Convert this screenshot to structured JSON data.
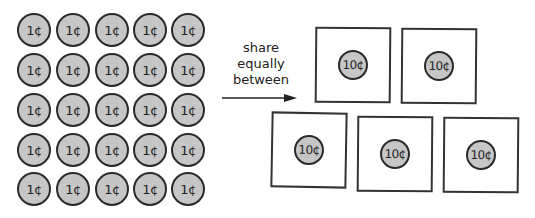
{
  "diagram": {
    "source_group": {
      "coin_label": "1¢",
      "rows": 5,
      "cols": 5,
      "count": 25,
      "coin_fill": "#c6c6c6",
      "centers_x": [
        34,
        73,
        112,
        150,
        188
      ],
      "centers_y": [
        30,
        70,
        110,
        150,
        189
      ]
    },
    "instruction": {
      "lines": [
        "share",
        "equally",
        "between"
      ]
    },
    "target_boxes": [
      {
        "coin_label": "10¢",
        "x": 315,
        "y": 27,
        "rot": 0.5
      },
      {
        "coin_label": "10¢",
        "x": 401,
        "y": 28,
        "rot": 0.5
      },
      {
        "coin_label": "10¢",
        "x": 271,
        "y": 112,
        "rot": 1
      },
      {
        "coin_label": "10¢",
        "x": 357,
        "y": 116,
        "rot": 0.5
      },
      {
        "coin_label": "10¢",
        "x": 443,
        "y": 117,
        "rot": 0.5
      }
    ]
  }
}
